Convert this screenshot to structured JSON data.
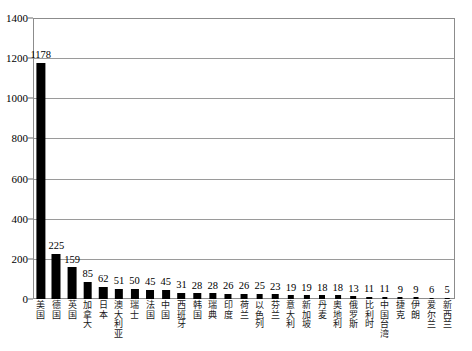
{
  "chart_data": {
    "type": "bar",
    "title": "",
    "xlabel": "",
    "ylabel": "",
    "ylim": [
      0,
      1400
    ],
    "ytick_step": 200,
    "yticks": [
      0,
      200,
      400,
      600,
      800,
      1000,
      1200,
      1400
    ],
    "grid": true,
    "legend": "none",
    "bar_color": "#000000",
    "background_color": "#ffffff",
    "gridline_color": "#9a9a9a",
    "frame_color": "#8c8c8c",
    "categories": [
      "美国",
      "德国",
      "英国",
      "加拿大",
      "日本",
      "澳大利亚",
      "瑞士",
      "法国",
      "中国",
      "西班牙",
      "韩国",
      "瑞典",
      "印度",
      "荷兰",
      "以色列",
      "芬兰",
      "意大利",
      "新加坡",
      "丹麦",
      "奥地利",
      "俄罗斯",
      "比利时",
      "中国台湾",
      "捷克",
      "伊朗",
      "爱尔兰",
      "新西兰"
    ],
    "values": [
      1178,
      225,
      159,
      85,
      62,
      51,
      50,
      45,
      45,
      31,
      28,
      28,
      26,
      26,
      25,
      23,
      19,
      19,
      18,
      18,
      13,
      11,
      11,
      9,
      9,
      6,
      5
    ],
    "data_labels": [
      "1178",
      "225",
      "159",
      "85",
      "62",
      "51",
      "50",
      "45",
      "45",
      "31",
      "28",
      "28",
      "26",
      "26",
      "25",
      "23",
      "19",
      "19",
      "18",
      "18",
      "13",
      "11",
      "11",
      "9",
      "9",
      "6",
      "5"
    ]
  }
}
